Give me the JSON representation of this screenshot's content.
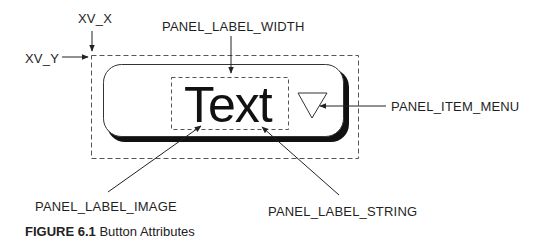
{
  "diagram": {
    "button_text": "Text",
    "labels": {
      "xv_x": "XV_X",
      "xv_y": "XV_Y",
      "panel_label_width": "PANEL_LABEL_WIDTH",
      "panel_item_menu": "PANEL_ITEM_MENU",
      "panel_label_image": "PANEL_LABEL_IMAGE",
      "panel_label_string": "PANEL_LABEL_STRING"
    },
    "caption": {
      "number": "FIGURE 6.1",
      "title": "Button Attributes"
    },
    "colors": {
      "line": "#333333",
      "dash": "#555555",
      "shadow": "#111111"
    }
  }
}
